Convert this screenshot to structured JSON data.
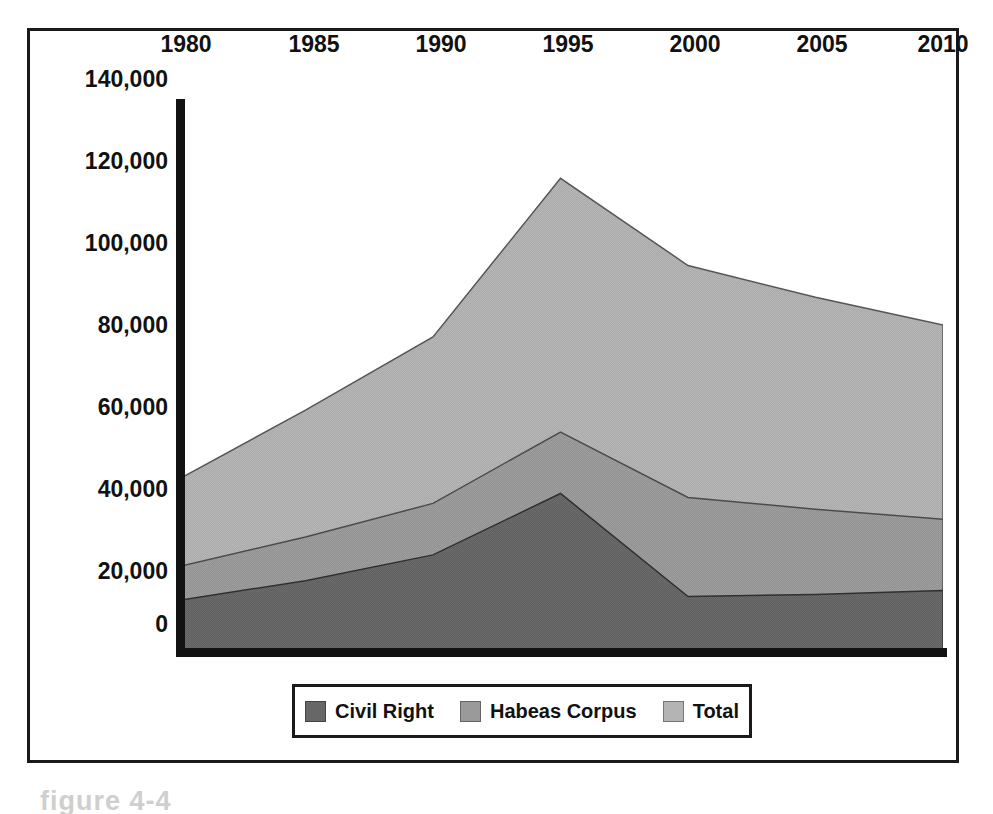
{
  "figure": {
    "caption": "figure 4-4"
  },
  "legend": {
    "position": "bottom-center",
    "entries": [
      {
        "label": "Civil Right",
        "color": "#676767"
      },
      {
        "label": "Habeas Corpus",
        "color": "#9a9a9a"
      },
      {
        "label": "Total",
        "color": "#b4b4b4"
      }
    ]
  },
  "axes": {
    "y_ticks": [
      "140,000",
      "120,000",
      "100,000",
      "80,000",
      "60,000",
      "40,000",
      "20,000",
      "0"
    ],
    "x_ticks": [
      "1980",
      "1985",
      "1990",
      "1995",
      "2000",
      "2005",
      "2010"
    ]
  },
  "chart_data": {
    "type": "area",
    "title": "",
    "xlabel": "",
    "ylabel": "",
    "stacked": false,
    "grid": false,
    "legend_position": "bottom-center",
    "x": [
      1980,
      1985,
      1990,
      1995,
      2000,
      2005,
      2010
    ],
    "xlim": [
      1980,
      2010
    ],
    "ylim": [
      0,
      140000
    ],
    "ytick_values": [
      0,
      20000,
      40000,
      60000,
      80000,
      100000,
      120000,
      140000
    ],
    "series": [
      {
        "name": "Total",
        "color": "#b4b4b4",
        "values": [
          44000,
          61500,
          80000,
          120000,
          98000,
          90000,
          83000
        ]
      },
      {
        "name": "Habeas Corpus",
        "color": "#9a9a9a",
        "values": [
          22000,
          29500,
          38000,
          56000,
          39500,
          36500,
          34000
        ]
      },
      {
        "name": "Civil Right",
        "color": "#676767",
        "values": [
          13500,
          18500,
          25000,
          40500,
          14500,
          15000,
          16000
        ]
      }
    ]
  }
}
